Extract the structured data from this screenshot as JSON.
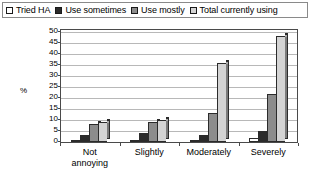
{
  "chart_data": {
    "type": "bar",
    "title": "",
    "subtitle": "",
    "xlabel": "",
    "ylabel": "%",
    "ylim": [
      0,
      50
    ],
    "ytick_step": 5,
    "yticks": [
      "50",
      "45",
      "40",
      "35",
      "30",
      "25",
      "20",
      "15",
      "10",
      "5",
      "0"
    ],
    "grid": true,
    "legend_position": "top",
    "categories": [
      "Not annoying",
      "Slightly",
      "Moderately",
      "Severely"
    ],
    "category_lines": [
      [
        "Not",
        "annoying"
      ],
      [
        "Slightly"
      ],
      [
        "Moderately"
      ],
      [
        "Severely"
      ]
    ],
    "series": [
      {
        "name": "Tried HA",
        "color": "#ffffff",
        "values": [
          1,
          1,
          1,
          2
        ]
      },
      {
        "name": "Use sometimes",
        "color": "#2b2b2b",
        "values": [
          3,
          4,
          3,
          5
        ]
      },
      {
        "name": "Use mostly",
        "color": "#8c8c8c",
        "values": [
          8,
          9,
          13,
          22
        ]
      },
      {
        "name": "Total currently using",
        "color": "#d4d4d4",
        "values": [
          9,
          10,
          36,
          48
        ]
      }
    ]
  },
  "legend": {
    "items": [
      {
        "label": "Tried HA",
        "swatch": "legend-swatch-tried-ha"
      },
      {
        "label": "Use sometimes",
        "swatch": "legend-swatch-use-sometimes"
      },
      {
        "label": "Use mostly",
        "swatch": "legend-swatch-use-mostly"
      },
      {
        "label": "Total currently using",
        "swatch": "legend-swatch-total-currently-using"
      }
    ]
  }
}
